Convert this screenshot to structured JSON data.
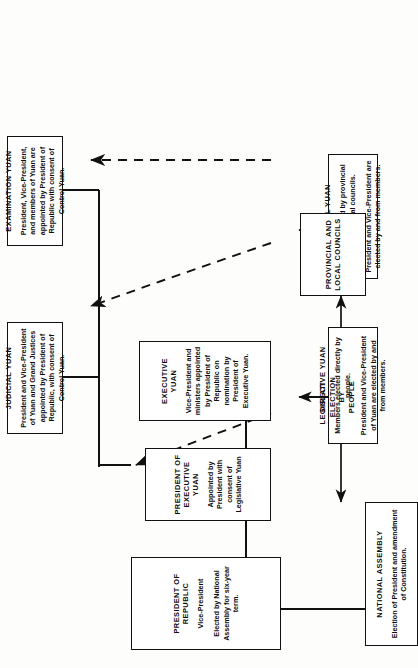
{
  "diagram": {
    "type": "organization-chart",
    "orientation": "rotated-90-ccw",
    "colors": {
      "line": "#111111",
      "box_fill": "#ffffff",
      "page": "#fdfdfb"
    }
  },
  "boxes": {
    "president_of_republic": {
      "title": "PRESIDENT OF REPUBLIC",
      "lines": [
        "Vice-President",
        "Elected by National Assembly for six-year term."
      ]
    },
    "president_of_executive_yuan": {
      "title": "PRESIDENT OF EXECUTIVE YUAN",
      "lines": [
        "Appointed by President with consent of Legislative Yuan"
      ]
    },
    "executive_yuan": {
      "title": "EXECUTIVE YUAN",
      "lines": [
        "Vice-President and ministers appointed by President of Republic on nomination by President of Executive Yuan."
      ]
    },
    "judicial_yuan": {
      "title": "JUDICIAL YUAN",
      "lines": [
        "President and Vice-President of Yuan and Grand Justices appointed by President of Republic, with consent of Control Yuan."
      ]
    },
    "examination_yuan": {
      "title": "EXAMINATION YUAN",
      "lines": [
        "President, Vice-President, and members of Yuan are appointed by President of Republic with consent of Control Yuan."
      ]
    },
    "legislative_yuan": {
      "title": "LEGISLATIVE YUAN",
      "lines": [
        "Members elected directly by people.",
        "President and Vice-President of Yuan are elected by and from members."
      ]
    },
    "control_yuan": {
      "title": "CONTROL YUAN",
      "lines": [
        "Members elected by provincial and other local councils.",
        "President and Vice-President are elected by and from members."
      ]
    },
    "national_assembly": {
      "title": "NATIONAL ASSEMBLY",
      "lines": [
        "Election of President and amendment of Constitution."
      ]
    },
    "provincial_and_local_councils": {
      "title": "PROVINCIAL AND LOCAL COUNCILS",
      "lines": []
    }
  },
  "labels": {
    "direct_election_by_people": "DIRECT\nELECTION\nBY\nPEOPLE"
  }
}
